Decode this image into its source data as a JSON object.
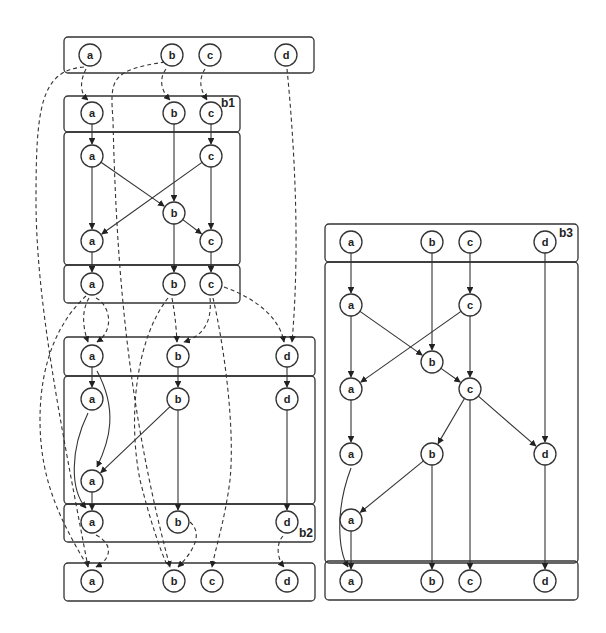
{
  "diagram": {
    "boxes": [
      {
        "id": "top-input",
        "x": 64,
        "y": 37,
        "w": 250,
        "h": 36
      },
      {
        "id": "b1-in",
        "x": 64,
        "y": 96,
        "w": 176,
        "h": 36
      },
      {
        "id": "b1-body",
        "x": 64,
        "y": 132,
        "w": 176,
        "h": 133
      },
      {
        "id": "b1-out",
        "x": 64,
        "y": 265,
        "w": 176,
        "h": 38
      },
      {
        "id": "b2-in",
        "x": 64,
        "y": 337,
        "w": 251,
        "h": 39
      },
      {
        "id": "b2-body",
        "x": 64,
        "y": 376,
        "w": 251,
        "h": 128
      },
      {
        "id": "b2-out",
        "x": 64,
        "y": 504,
        "w": 251,
        "h": 38
      },
      {
        "id": "final-output",
        "x": 64,
        "y": 563,
        "w": 251,
        "h": 38
      },
      {
        "id": "b3-in",
        "x": 325,
        "y": 224,
        "w": 253,
        "h": 38
      },
      {
        "id": "b3-body",
        "x": 325,
        "y": 262,
        "w": 253,
        "h": 301
      },
      {
        "id": "b3-out",
        "x": 325,
        "y": 561,
        "w": 253,
        "h": 39
      }
    ],
    "box_labels": [
      {
        "text": "b1",
        "x": 221,
        "y": 107
      },
      {
        "text": "b2",
        "x": 299,
        "y": 537
      },
      {
        "text": "b3",
        "x": 559,
        "y": 237
      }
    ],
    "nodes": [
      {
        "id": "t-a",
        "label": "a",
        "x": 90,
        "y": 55
      },
      {
        "id": "t-b",
        "label": "b",
        "x": 172,
        "y": 55
      },
      {
        "id": "t-c",
        "label": "c",
        "x": 210,
        "y": 55
      },
      {
        "id": "t-d",
        "label": "d",
        "x": 286,
        "y": 55
      },
      {
        "id": "b1i-a",
        "label": "a",
        "x": 92,
        "y": 113
      },
      {
        "id": "b1i-b",
        "label": "b",
        "x": 174,
        "y": 113
      },
      {
        "id": "b1i-c",
        "label": "c",
        "x": 211,
        "y": 113
      },
      {
        "id": "b1m-a1",
        "label": "a",
        "x": 92,
        "y": 156
      },
      {
        "id": "b1m-c1",
        "label": "c",
        "x": 211,
        "y": 156
      },
      {
        "id": "b1m-b",
        "label": "b",
        "x": 174,
        "y": 213
      },
      {
        "id": "b1m-a2",
        "label": "a",
        "x": 92,
        "y": 241
      },
      {
        "id": "b1m-c2",
        "label": "c",
        "x": 211,
        "y": 241
      },
      {
        "id": "b1o-a",
        "label": "a",
        "x": 92,
        "y": 284
      },
      {
        "id": "b1o-b",
        "label": "b",
        "x": 174,
        "y": 284
      },
      {
        "id": "b1o-c",
        "label": "c",
        "x": 211,
        "y": 284
      },
      {
        "id": "b2i-a",
        "label": "a",
        "x": 92,
        "y": 356
      },
      {
        "id": "b2i-b",
        "label": "b",
        "x": 178,
        "y": 356
      },
      {
        "id": "b2i-d",
        "label": "d",
        "x": 287,
        "y": 356
      },
      {
        "id": "b2m-a1",
        "label": "a",
        "x": 92,
        "y": 399
      },
      {
        "id": "b2m-b",
        "label": "b",
        "x": 178,
        "y": 399
      },
      {
        "id": "b2m-d",
        "label": "d",
        "x": 287,
        "y": 399
      },
      {
        "id": "b2m-a2",
        "label": "a",
        "x": 92,
        "y": 481
      },
      {
        "id": "b2o-a",
        "label": "a",
        "x": 92,
        "y": 522
      },
      {
        "id": "b2o-b",
        "label": "b",
        "x": 178,
        "y": 522
      },
      {
        "id": "b2o-d",
        "label": "d",
        "x": 287,
        "y": 522
      },
      {
        "id": "f-a",
        "label": "a",
        "x": 92,
        "y": 581
      },
      {
        "id": "f-b",
        "label": "b",
        "x": 174,
        "y": 581
      },
      {
        "id": "f-c",
        "label": "c",
        "x": 212,
        "y": 581
      },
      {
        "id": "f-d",
        "label": "d",
        "x": 287,
        "y": 581
      },
      {
        "id": "b3i-a",
        "label": "a",
        "x": 351,
        "y": 242
      },
      {
        "id": "b3i-b",
        "label": "b",
        "x": 432,
        "y": 242
      },
      {
        "id": "b3i-c",
        "label": "c",
        "x": 470,
        "y": 242
      },
      {
        "id": "b3i-d",
        "label": "d",
        "x": 545,
        "y": 242
      },
      {
        "id": "b3m-a1",
        "label": "a",
        "x": 351,
        "y": 305
      },
      {
        "id": "b3m-c1",
        "label": "c",
        "x": 470,
        "y": 305
      },
      {
        "id": "b3m-b1",
        "label": "b",
        "x": 432,
        "y": 362
      },
      {
        "id": "b3m-a2",
        "label": "a",
        "x": 351,
        "y": 389
      },
      {
        "id": "b3m-c2",
        "label": "c",
        "x": 470,
        "y": 389
      },
      {
        "id": "b3m-a3",
        "label": "a",
        "x": 351,
        "y": 454
      },
      {
        "id": "b3m-b2",
        "label": "b",
        "x": 432,
        "y": 454
      },
      {
        "id": "b3m-d",
        "label": "d",
        "x": 545,
        "y": 454
      },
      {
        "id": "b3m-a4",
        "label": "a",
        "x": 351,
        "y": 520
      },
      {
        "id": "b3o-a",
        "label": "a",
        "x": 351,
        "y": 581
      },
      {
        "id": "b3o-b",
        "label": "b",
        "x": 432,
        "y": 581
      },
      {
        "id": "b3o-c",
        "label": "c",
        "x": 470,
        "y": 581
      },
      {
        "id": "b3o-d",
        "label": "d",
        "x": 545,
        "y": 581
      }
    ],
    "solid_edges": [
      {
        "from": "b1i-a",
        "to": "b1m-a1"
      },
      {
        "from": "b1i-b",
        "to": "b1m-b"
      },
      {
        "from": "b1i-c",
        "to": "b1m-c1"
      },
      {
        "from": "b1m-a1",
        "to": "b1m-a2"
      },
      {
        "from": "b1m-a1",
        "to": "b1m-b"
      },
      {
        "from": "b1m-c1",
        "to": "b1m-a2"
      },
      {
        "from": "b1m-c1",
        "to": "b1m-c2"
      },
      {
        "from": "b1m-b",
        "to": "b1m-c2"
      },
      {
        "from": "b1m-b",
        "to": "b1o-b"
      },
      {
        "from": "b1m-a2",
        "to": "b1o-a"
      },
      {
        "from": "b1m-c2",
        "to": "b1o-c"
      },
      {
        "from": "b2i-a",
        "to": "b2m-a1"
      },
      {
        "from": "b2i-b",
        "to": "b2m-b"
      },
      {
        "from": "b2i-d",
        "to": "b2m-d"
      },
      {
        "from": "b2m-b",
        "to": "b2m-a2"
      },
      {
        "from": "b2m-b",
        "to": "b2o-b"
      },
      {
        "from": "b2m-d",
        "to": "b2o-d"
      },
      {
        "from": "b2m-a2",
        "to": "b2o-a"
      },
      {
        "from": "b3i-a",
        "to": "b3m-a1"
      },
      {
        "from": "b3i-b",
        "to": "b3m-b1"
      },
      {
        "from": "b3i-c",
        "to": "b3m-c1"
      },
      {
        "from": "b3i-d",
        "to": "b3m-d"
      },
      {
        "from": "b3m-a1",
        "to": "b3m-a2"
      },
      {
        "from": "b3m-a1",
        "to": "b3m-b1"
      },
      {
        "from": "b3m-c1",
        "to": "b3m-a2"
      },
      {
        "from": "b3m-c1",
        "to": "b3m-c2"
      },
      {
        "from": "b3m-b1",
        "to": "b3m-c2"
      },
      {
        "from": "b3m-a2",
        "to": "b3m-a3"
      },
      {
        "from": "b3m-c2",
        "to": "b3m-b2"
      },
      {
        "from": "b3m-c2",
        "to": "b3m-d"
      },
      {
        "from": "b3m-c2",
        "to": "b3o-c"
      },
      {
        "from": "b3m-b2",
        "to": "b3m-a4"
      },
      {
        "from": "b3m-b2",
        "to": "b3o-b"
      },
      {
        "from": "b3m-d",
        "to": "b3o-d"
      },
      {
        "from": "b3m-a4",
        "to": "b3o-a"
      }
    ],
    "solid_curves": [
      {
        "d": "M 97 371 C 118 410, 110 440, 97 467",
        "arrow_to": "b2m-a2"
      },
      {
        "d": "M 88 413 C 70 450, 70 490, 86 508",
        "arrow_to": "b2o-a"
      },
      {
        "d": "M 351 468 C 335 510, 338 550, 348 567",
        "arrow_to": "b3o-a"
      }
    ],
    "dashed_curves": [
      {
        "d": "M 84 67 C 40 70, 36 110, 36 200 C 36 300, 60 420, 88 567",
        "arrow": true
      },
      {
        "d": "M 86 69 C 78 85, 82 95, 88 100",
        "arrow": true
      },
      {
        "d": "M 166 69 C 158 80, 162 92, 170 100",
        "arrow": true
      },
      {
        "d": "M 165 62 C 110 70, 110 80, 113 120 C 116 250, 125 400, 170 567",
        "arrow": true
      },
      {
        "d": "M 205 69 C 197 82, 202 92, 207 100",
        "arrow": true
      },
      {
        "d": "M 287 69 C 295 150, 300 250, 292 342",
        "arrow": true
      },
      {
        "d": "M 89 298 C 82 310, 82 325, 88 342",
        "arrow": true
      },
      {
        "d": "M 96 298 C 110 305, 115 330, 97 342",
        "arrow": true
      },
      {
        "d": "M 86 296 C 60 320, 40 360, 40 420 C 40 480, 60 520, 88 567",
        "arrow": false
      },
      {
        "d": "M 172 298 C 175 315, 176 325, 177 342",
        "arrow": true
      },
      {
        "d": "M 168 298 C 135 340, 128 420, 140 480 C 150 520, 160 550, 168 567",
        "arrow": false
      },
      {
        "d": "M 210 298 C 212 320, 205 335, 184 342",
        "arrow": true
      },
      {
        "d": "M 213 298 C 225 350, 235 430, 230 480 C 225 520, 215 550, 212 567",
        "arrow": true
      },
      {
        "d": "M 224 287 C 260 300, 280 320, 284 342",
        "arrow": true
      },
      {
        "d": "M 96 535 C 115 545, 110 560, 96 567",
        "arrow": true
      },
      {
        "d": "M 190 522 C 205 535, 190 555, 178 567",
        "arrow": true
      },
      {
        "d": "M 283 536 C 275 545, 278 560, 284 567",
        "arrow": true
      }
    ]
  }
}
